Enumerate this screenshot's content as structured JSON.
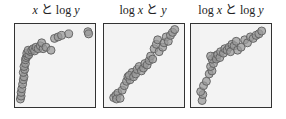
{
  "chart_data": [
    {
      "type": "scatter",
      "title": "x と log y",
      "title_parts": [
        {
          "text": "x",
          "italic": true
        },
        {
          "text": " と ",
          "italic": false
        },
        {
          "text": "log ",
          "italic": false
        },
        {
          "text": "y",
          "italic": true
        }
      ],
      "xlabel": "x",
      "ylabel": "log y",
      "grid": false,
      "axes_ticks": false,
      "shape": "concave, rapid rise near x=0 then plateau",
      "points": [
        [
          0.02,
          0.04
        ],
        [
          0.03,
          0.08
        ],
        [
          0.03,
          0.13
        ],
        [
          0.04,
          0.18
        ],
        [
          0.05,
          0.24
        ],
        [
          0.06,
          0.3
        ],
        [
          0.07,
          0.34
        ],
        [
          0.06,
          0.4
        ],
        [
          0.08,
          0.44
        ],
        [
          0.07,
          0.48
        ],
        [
          0.09,
          0.52
        ],
        [
          0.09,
          0.57
        ],
        [
          0.1,
          0.6
        ],
        [
          0.12,
          0.62
        ],
        [
          0.11,
          0.66
        ],
        [
          0.14,
          0.64
        ],
        [
          0.16,
          0.68
        ],
        [
          0.13,
          0.7
        ],
        [
          0.18,
          0.7
        ],
        [
          0.2,
          0.72
        ],
        [
          0.22,
          0.69
        ],
        [
          0.24,
          0.74
        ],
        [
          0.27,
          0.72
        ],
        [
          0.3,
          0.76
        ],
        [
          0.34,
          0.72
        ],
        [
          0.32,
          0.8
        ],
        [
          0.38,
          0.74
        ],
        [
          0.45,
          0.7
        ],
        [
          0.5,
          0.86
        ],
        [
          0.55,
          0.88
        ],
        [
          0.6,
          0.9
        ],
        [
          0.7,
          0.92
        ],
        [
          0.97,
          0.95
        ],
        [
          0.98,
          0.92
        ]
      ],
      "panel": {
        "left": 14,
        "width": 82
      },
      "title_center": 56
    },
    {
      "type": "scatter",
      "title": "log x と y",
      "title_parts": [
        {
          "text": "log ",
          "italic": false
        },
        {
          "text": "x",
          "italic": true
        },
        {
          "text": " と ",
          "italic": false
        },
        {
          "text": "y",
          "italic": true
        }
      ],
      "xlabel": "log x",
      "ylabel": "y",
      "grid": false,
      "axes_ticks": false,
      "shape": "convex, increasing roughly linear trend",
      "points": [
        [
          0.08,
          0.06
        ],
        [
          0.11,
          0.09
        ],
        [
          0.14,
          0.12
        ],
        [
          0.12,
          0.04
        ],
        [
          0.17,
          0.05
        ],
        [
          0.2,
          0.16
        ],
        [
          0.23,
          0.22
        ],
        [
          0.26,
          0.28
        ],
        [
          0.28,
          0.34
        ],
        [
          0.31,
          0.3
        ],
        [
          0.34,
          0.4
        ],
        [
          0.3,
          0.36
        ],
        [
          0.36,
          0.34
        ],
        [
          0.39,
          0.38
        ],
        [
          0.41,
          0.44
        ],
        [
          0.44,
          0.48
        ],
        [
          0.47,
          0.42
        ],
        [
          0.5,
          0.46
        ],
        [
          0.52,
          0.52
        ],
        [
          0.55,
          0.5
        ],
        [
          0.58,
          0.56
        ],
        [
          0.6,
          0.62
        ],
        [
          0.63,
          0.58
        ],
        [
          0.65,
          0.72
        ],
        [
          0.68,
          0.78
        ],
        [
          0.7,
          0.84
        ],
        [
          0.72,
          0.68
        ],
        [
          0.77,
          0.74
        ],
        [
          0.79,
          0.8
        ],
        [
          0.82,
          0.88
        ],
        [
          0.85,
          0.82
        ],
        [
          0.88,
          0.9
        ],
        [
          0.91,
          0.94
        ],
        [
          0.94,
          0.98
        ]
      ],
      "panel": {
        "left": 103,
        "width": 82
      },
      "title_center": 143
    },
    {
      "type": "scatter",
      "title": "log x と log y",
      "title_parts": [
        {
          "text": "log ",
          "italic": false
        },
        {
          "text": "x",
          "italic": true
        },
        {
          "text": " と ",
          "italic": false
        },
        {
          "text": "log ",
          "italic": false
        },
        {
          "text": "y",
          "italic": true
        }
      ],
      "xlabel": "log x",
      "ylabel": "log y",
      "grid": false,
      "axes_ticks": false,
      "shape": "concave, increasing",
      "points": [
        [
          0.1,
          0.02
        ],
        [
          0.11,
          0.1
        ],
        [
          0.08,
          0.14
        ],
        [
          0.12,
          0.22
        ],
        [
          0.16,
          0.28
        ],
        [
          0.2,
          0.38
        ],
        [
          0.24,
          0.42
        ],
        [
          0.22,
          0.48
        ],
        [
          0.26,
          0.52
        ],
        [
          0.24,
          0.58
        ],
        [
          0.28,
          0.62
        ],
        [
          0.22,
          0.62
        ],
        [
          0.3,
          0.58
        ],
        [
          0.32,
          0.64
        ],
        [
          0.35,
          0.6
        ],
        [
          0.36,
          0.68
        ],
        [
          0.4,
          0.66
        ],
        [
          0.42,
          0.72
        ],
        [
          0.45,
          0.7
        ],
        [
          0.48,
          0.74
        ],
        [
          0.5,
          0.68
        ],
        [
          0.52,
          0.78
        ],
        [
          0.55,
          0.76
        ],
        [
          0.58,
          0.82
        ],
        [
          0.6,
          0.7
        ],
        [
          0.65,
          0.74
        ],
        [
          0.7,
          0.84
        ],
        [
          0.74,
          0.8
        ],
        [
          0.78,
          0.88
        ],
        [
          0.82,
          0.86
        ],
        [
          0.86,
          0.9
        ],
        [
          0.9,
          0.92
        ],
        [
          0.94,
          0.96
        ]
      ],
      "panel": {
        "left": 190,
        "width": 82
      },
      "title_center": 231
    }
  ],
  "style": {
    "marker_fill": "#9a9a9a",
    "marker_stroke": "#5e5e5e",
    "marker_radius": 4,
    "plot_background": "#f3f3f3",
    "frame_color": "#333333"
  }
}
